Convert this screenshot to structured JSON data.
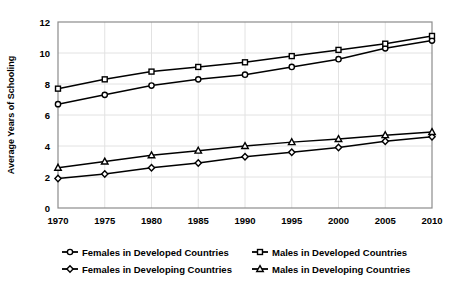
{
  "chart_data": {
    "type": "line",
    "title": "",
    "xlabel": "",
    "ylabel": "Average Years of Schooling",
    "x": [
      1970,
      1975,
      1980,
      1985,
      1990,
      1995,
      2000,
      2005,
      2010
    ],
    "xtick_labels": [
      "1970",
      "1975",
      "1980",
      "1985",
      "1990",
      "1995",
      "2000",
      "2005",
      "2010"
    ],
    "ytick_labels": [
      "0",
      "2",
      "4",
      "6",
      "8",
      "10",
      "12"
    ],
    "yticks": [
      0,
      2,
      4,
      6,
      8,
      10,
      12
    ],
    "xlim": [
      1970,
      2010
    ],
    "ylim": [
      0,
      12
    ],
    "grid": true,
    "legend_position": "bottom",
    "series": [
      {
        "name": "Females in Developed Countries",
        "marker": "circle",
        "values": [
          6.7,
          7.3,
          7.9,
          8.3,
          8.6,
          9.1,
          9.6,
          10.3,
          10.8
        ]
      },
      {
        "name": "Males in Developed Countries",
        "marker": "square",
        "values": [
          7.7,
          8.3,
          8.8,
          9.1,
          9.4,
          9.8,
          10.2,
          10.6,
          11.1
        ]
      },
      {
        "name": "Females in Developing Countries",
        "marker": "diamond",
        "values": [
          1.9,
          2.2,
          2.6,
          2.9,
          3.3,
          3.6,
          3.9,
          4.3,
          4.6
        ]
      },
      {
        "name": "Males in Developing Countries",
        "marker": "triangle",
        "values": [
          2.6,
          3.0,
          3.4,
          3.7,
          4.0,
          4.25,
          4.45,
          4.7,
          4.9
        ]
      }
    ]
  },
  "legend": {
    "entries": [
      {
        "label": "Females in Developed Countries",
        "marker": "circle"
      },
      {
        "label": "Males in Developed Countries",
        "marker": "square"
      },
      {
        "label": "Females in Developing Countries",
        "marker": "diamond"
      },
      {
        "label": "Males in Developing Countries",
        "marker": "triangle"
      }
    ]
  },
  "colors": {
    "line": "#000000",
    "marker_fill": "#ffffff",
    "grid": "#e2e2e2",
    "frame": "#8c8c8c",
    "text": "#000000",
    "background": "#ffffff"
  }
}
